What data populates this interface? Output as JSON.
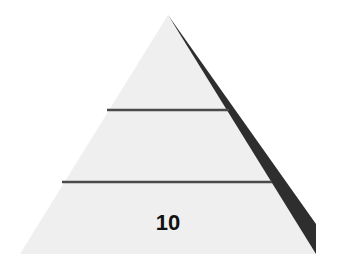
{
  "diagram": {
    "type": "pyramid",
    "tiers": [
      {
        "position": "top",
        "label": ""
      },
      {
        "position": "middle",
        "label": ""
      },
      {
        "position": "bottom",
        "label": "10"
      }
    ],
    "colors": {
      "face": "#efefef",
      "shadow": "#2e2e2e",
      "divider": "#4a4a4a",
      "label": "#111111",
      "background": "#ffffff"
    }
  }
}
